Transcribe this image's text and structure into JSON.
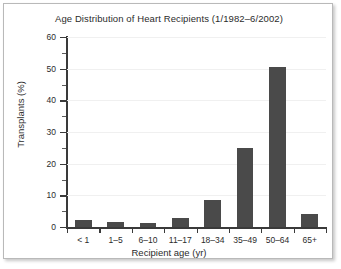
{
  "figure": {
    "background_color": "#ffffff",
    "border_color": "#b9b9b9",
    "bar_color": "#4a4a4a",
    "axis_color": "#3a3a3a",
    "gridline_color": "#f0f0f0"
  },
  "chart_data": {
    "type": "bar",
    "title": "Age Distribution of Heart Recipients (1/1982–6/2002)",
    "xlabel": "Recipient age (yr)",
    "ylabel": "Transplants (%)",
    "categories": [
      "< 1",
      "1–5",
      "6–10",
      "11–17",
      "18–34",
      "35–49",
      "50–64",
      "65+"
    ],
    "values": [
      2.2,
      1.7,
      1.2,
      3.0,
      8.5,
      25.0,
      50.5,
      4.0
    ],
    "ylim": [
      0,
      60
    ],
    "ytick_labels": [
      "0",
      "10",
      "20",
      "30",
      "40",
      "50",
      "60"
    ],
    "ytick_values": [
      0,
      10,
      20,
      30,
      40,
      50,
      60
    ],
    "yminor_tick_values": [
      5,
      15,
      25,
      35,
      45,
      55
    ],
    "grid": "horizontal",
    "legend": "none"
  }
}
